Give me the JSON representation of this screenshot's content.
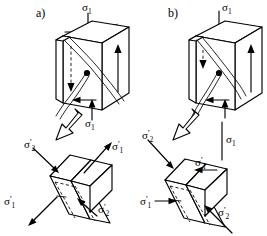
{
  "figure": {
    "background_color": "#ffffff",
    "line_color": "#000000"
  },
  "panels": [
    {
      "id": "a",
      "label": "a)",
      "cube": {
        "name": "stress-cube-a",
        "top_stress_label": "σ1",
        "top_stress_sub": "1",
        "shear_stress_label": "σ6",
        "shear_stress_sub": "6",
        "bottom_stress_label": "σ1",
        "bottom_stress_sub": "1",
        "fracture_description": "diagonal fracture band from upper-left to lower-right through centre point",
        "centre_marker": "fracture-origin-dot",
        "left_arrow_style": "dashed-down",
        "right_arrow_style": "solid-up"
      },
      "transition_arrow": "hollow-block-arrow-down-left",
      "block": {
        "name": "principal-stress-block-a",
        "loading_type": "tension",
        "labels": [
          {
            "key": "sigma2-prime-top-left",
            "text": "σ",
            "prime": "'",
            "sub": "2",
            "direction": "inward-down-right"
          },
          {
            "key": "sigma1-prime-top-right",
            "text": "σ",
            "prime": "'",
            "sub": "1",
            "direction": "outward-up-right"
          },
          {
            "key": "sigma1-prime-bottom-left",
            "text": "σ",
            "prime": "'",
            "sub": "1",
            "direction": "outward-down-left"
          },
          {
            "key": "sigma2-prime-bottom-right",
            "text": "σ",
            "prime": "'",
            "sub": "2",
            "direction": "inward-up-left"
          }
        ]
      }
    },
    {
      "id": "b",
      "label": "b)",
      "cube": {
        "name": "stress-cube-b",
        "top_stress_label": "σ1",
        "top_stress_sub": "1",
        "shear_stress_label": "σ6",
        "shear_stress_sub": "6",
        "bottom_stress_label": "σ1",
        "bottom_stress_sub": "1",
        "fracture_description": "diagonal fracture band from upper-right to lower-left through centre point",
        "centre_marker": "fracture-origin-dot",
        "left_arrow_style": "dashed-down",
        "right_arrow_style": "solid-up"
      },
      "transition_arrow": "hollow-block-arrow-down-left",
      "block": {
        "name": "principal-stress-block-b",
        "loading_type": "compression",
        "labels": [
          {
            "key": "sigma2-prime-top-left",
            "text": "σ",
            "prime": "'",
            "sub": "2",
            "direction": "inward-down-right"
          },
          {
            "key": "sigma1-prime-top-right",
            "text": "σ",
            "prime": "'",
            "sub": "1",
            "direction": "inward-left"
          },
          {
            "key": "sigma1-prime-bottom-left",
            "text": "σ",
            "prime": "'",
            "sub": "1",
            "direction": "inward-right"
          },
          {
            "key": "sigma2-prime-bottom-right",
            "text": "σ",
            "prime": "'",
            "sub": "2",
            "direction": "inward-up-left"
          }
        ]
      }
    }
  ],
  "symbols": {
    "sigma": "σ",
    "prime": "'",
    "sub_1": "1",
    "sub_2": "2",
    "sub_6": "6"
  }
}
